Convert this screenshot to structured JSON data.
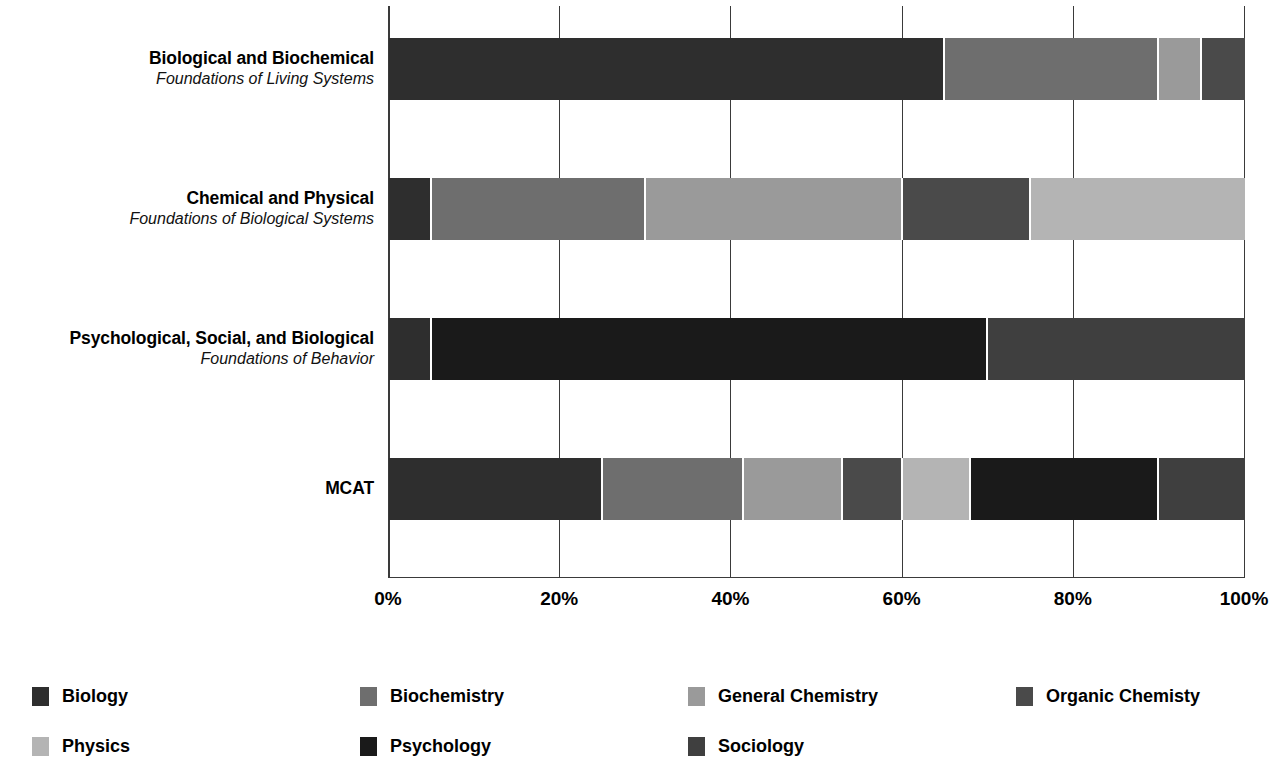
{
  "chart_data": {
    "type": "bar",
    "subtype": "stacked-horizontal-100-percent",
    "title": "",
    "xlabel": "",
    "ylabel": "",
    "xlim": [
      0,
      100
    ],
    "xticks": [
      0,
      20,
      40,
      60,
      80,
      100
    ],
    "xtick_labels": [
      "0%",
      "20%",
      "40%",
      "60%",
      "80%",
      "100%"
    ],
    "grid": true,
    "grid_axis": "x",
    "legend_position": "bottom",
    "stacked_total": 100,
    "categories": [
      {
        "title": "Biological and Biochemical",
        "subtitle": "Foundations of Living Systems"
      },
      {
        "title": "Chemical and Physical",
        "subtitle": "Foundations of Biological Systems"
      },
      {
        "title": "Psychological, Social, and Biological",
        "subtitle": "Foundations of Behavior"
      },
      {
        "title": "MCAT",
        "subtitle": ""
      }
    ],
    "series": [
      {
        "name": "Biology",
        "color": "#2e2e2e",
        "values": [
          65,
          5,
          5,
          25
        ]
      },
      {
        "name": "Biochemistry",
        "color": "#6e6e6e",
        "values": [
          25,
          25,
          0,
          16.5
        ]
      },
      {
        "name": "General Chemistry",
        "color": "#9a9a9a",
        "values": [
          5,
          30,
          0,
          11.5
        ]
      },
      {
        "name": "Organic Chemisty",
        "color": "#4a4a4a",
        "values": [
          5,
          15,
          0,
          7
        ]
      },
      {
        "name": "Physics",
        "color": "#b4b4b4",
        "values": [
          0,
          25,
          0,
          8
        ]
      },
      {
        "name": "Psychology",
        "color": "#1a1a1a",
        "values": [
          0,
          0,
          65,
          22
        ]
      },
      {
        "name": "Sociology",
        "color": "#3f3f3f",
        "values": [
          0,
          0,
          30,
          10
        ]
      }
    ],
    "bars": [
      {
        "category": "Biological and Biochemical",
        "segments": [
          {
            "series": "Biology",
            "value": 65,
            "color": "#2e2e2e"
          },
          {
            "series": "Biochemistry",
            "value": 25,
            "color": "#6e6e6e"
          },
          {
            "series": "General Chemistry",
            "value": 5,
            "color": "#9a9a9a"
          },
          {
            "series": "Organic Chemisty",
            "value": 5,
            "color": "#4a4a4a"
          }
        ]
      },
      {
        "category": "Chemical and Physical",
        "segments": [
          {
            "series": "Biology",
            "value": 5,
            "color": "#2e2e2e"
          },
          {
            "series": "Biochemistry",
            "value": 25,
            "color": "#6e6e6e"
          },
          {
            "series": "General Chemistry",
            "value": 30,
            "color": "#9a9a9a"
          },
          {
            "series": "Organic Chemisty",
            "value": 15,
            "color": "#4a4a4a"
          },
          {
            "series": "Physics",
            "value": 25,
            "color": "#b4b4b4"
          }
        ]
      },
      {
        "category": "Psychological, Social, and Biological",
        "segments": [
          {
            "series": "Biology",
            "value": 5,
            "color": "#2e2e2e"
          },
          {
            "series": "Psychology",
            "value": 65,
            "color": "#1a1a1a"
          },
          {
            "series": "Sociology",
            "value": 30,
            "color": "#3f3f3f"
          }
        ]
      },
      {
        "category": "MCAT",
        "segments": [
          {
            "series": "Biology",
            "value": 25,
            "color": "#2e2e2e"
          },
          {
            "series": "Biochemistry",
            "value": 16.5,
            "color": "#6e6e6e"
          },
          {
            "series": "General Chemistry",
            "value": 11.5,
            "color": "#9a9a9a"
          },
          {
            "series": "Organic Chemisty",
            "value": 7,
            "color": "#4a4a4a"
          },
          {
            "series": "Physics",
            "value": 8,
            "color": "#b4b4b4"
          },
          {
            "series": "Psychology",
            "value": 22,
            "color": "#1a1a1a"
          },
          {
            "series": "Sociology",
            "value": 10,
            "color": "#3f3f3f"
          }
        ]
      }
    ],
    "legend": [
      {
        "label": "Biology",
        "color": "#2e2e2e"
      },
      {
        "label": "Biochemistry",
        "color": "#6e6e6e"
      },
      {
        "label": "General Chemistry",
        "color": "#9a9a9a"
      },
      {
        "label": "Organic Chemisty",
        "color": "#4a4a4a"
      },
      {
        "label": "Physics",
        "color": "#b4b4b4"
      },
      {
        "label": "Psychology",
        "color": "#1a1a1a"
      },
      {
        "label": "Sociology",
        "color": "#3f3f3f"
      }
    ]
  }
}
